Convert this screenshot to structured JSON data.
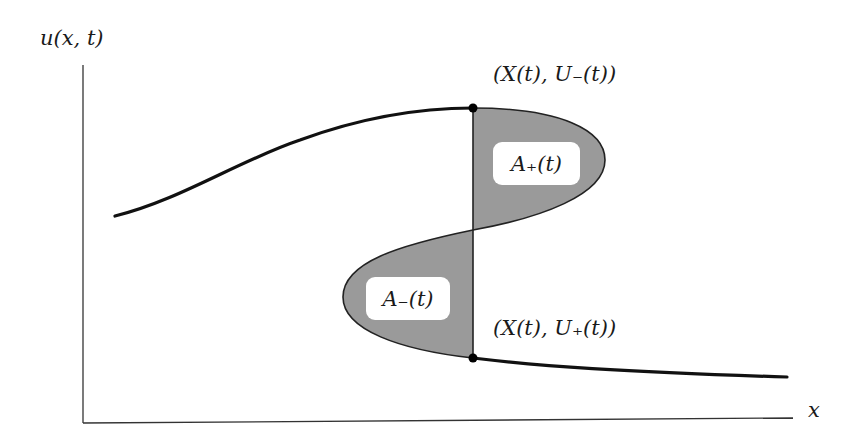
{
  "diagram": {
    "y_axis_label": "u(x, t)",
    "x_axis_label": "x",
    "point_top_label": "(X(t), U₋(t))",
    "point_bottom_label": "(X(t), U₊(t))",
    "area_plus_label": "A₊(t)",
    "area_minus_label": "A₋(t)",
    "colors": {
      "curve": "#111111",
      "axis": "#333333",
      "shaded_area": "#9a9a9a",
      "label_box": "#ffffff"
    }
  }
}
